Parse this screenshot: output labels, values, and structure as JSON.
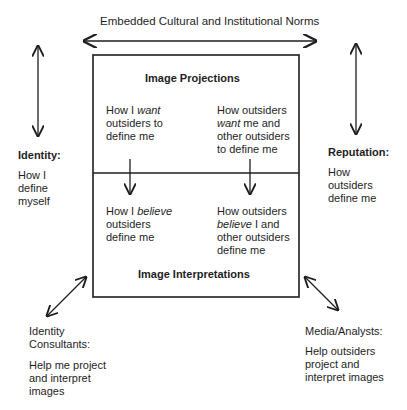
{
  "diagram": {
    "top_label": "Embedded Cultural and Institutional Norms",
    "box": {
      "top_heading": "Image Projections",
      "bottom_heading": "Image Interpretations",
      "cells": {
        "top_left": {
          "pre": "How I ",
          "em": "want",
          "post": "\noutsiders to\ndefine me"
        },
        "top_right": {
          "pre": "How outsiders\n",
          "em": "want",
          "post": " me and\nother outsiders\nto define me"
        },
        "bottom_left": {
          "pre": "How I ",
          "em": "believe",
          "post": "\noutsiders\ndefine me"
        },
        "bottom_right": {
          "pre": "How outsiders\n",
          "em": "believe",
          "post": " I and\nother outsiders\ndefine me"
        }
      }
    },
    "left": {
      "heading": "Identity:",
      "body": "How I\ndefine\nmyself"
    },
    "right": {
      "heading": "Reputation:",
      "body": "How\noutsiders\ndefine me"
    },
    "bottom_left": {
      "heading": "Identity\nConsultants:",
      "body": "Help me project\nand interpret\nimages"
    },
    "bottom_right": {
      "heading": "Media/Analysts:",
      "body": "Help outsiders\nproject and\ninterpret images"
    }
  }
}
